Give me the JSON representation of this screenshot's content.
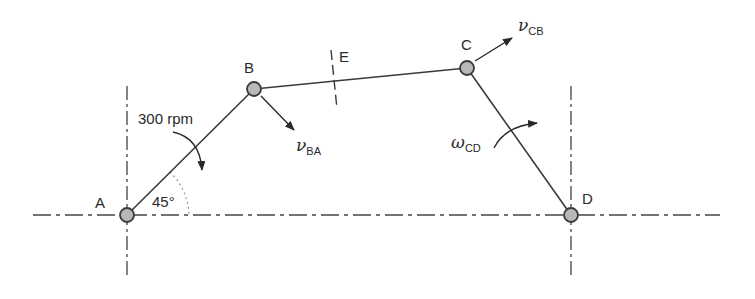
{
  "diagram": {
    "joints": {
      "A": {
        "label": "A",
        "x": 127,
        "y": 215
      },
      "B": {
        "label": "B",
        "x": 254,
        "y": 89
      },
      "C": {
        "label": "C",
        "x": 467,
        "y": 68
      },
      "D": {
        "label": "D",
        "x": 571,
        "y": 215
      }
    },
    "section_mark": {
      "label": "E"
    },
    "input": {
      "speed_label": "300 rpm",
      "angle_label": "45°"
    },
    "vectors": {
      "vBA": {
        "symbol": "ν",
        "subscript": "BA"
      },
      "vCB": {
        "symbol": "ν",
        "subscript": "CB"
      },
      "wCD": {
        "symbol": "ω",
        "subscript": "CD"
      }
    },
    "colors": {
      "link": "#3a3a3a",
      "joint_fill": "#b8b8b8",
      "centerline": "#444444",
      "angle_arc": "#999999"
    }
  }
}
